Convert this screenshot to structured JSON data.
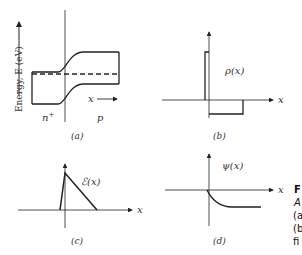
{
  "figure": {
    "side_caption": {
      "title_fragment": "F",
      "lines": [
        "A",
        "(a",
        "(b",
        "fi"
      ]
    },
    "panels": [
      {
        "id": "a",
        "caption": "(a)",
        "y_axis_label": "Energy, E (eV)",
        "x_label": "x",
        "region_left": "n+",
        "region_left_base": "n",
        "region_left_sup": "+",
        "region_right": "p",
        "description": "Energy band diagram of n+-p junction with Fermi level dashed"
      },
      {
        "id": "b",
        "caption": "(b)",
        "curve_label": "ρ(x)",
        "x_label": "x",
        "description": "Charge density: narrow tall positive block on n+ side, wide shallow negative block on p side"
      },
      {
        "id": "c",
        "caption": "(c)",
        "curve_label": "ℰ(x)",
        "x_label": "x",
        "description": "Electric field: triangular profile peaking at junction"
      },
      {
        "id": "d",
        "caption": "(d)",
        "curve_label": "ψ(x)",
        "x_label": "x",
        "description": "Potential: decays from zero at junction to a constant negative value"
      }
    ],
    "colors": {
      "line": "#222222",
      "background": "#ffffff"
    }
  }
}
